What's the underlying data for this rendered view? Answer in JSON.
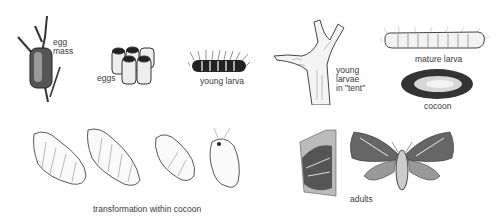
{
  "diagram": {
    "title": "",
    "stages": [
      {
        "id": "egg-mass",
        "label": "egg\nmass"
      },
      {
        "id": "eggs",
        "label": "eggs"
      },
      {
        "id": "young-larva",
        "label": "young larva"
      },
      {
        "id": "young-larvae-tent",
        "label": "young\nlarvae\nin \"tent\""
      },
      {
        "id": "mature-larva",
        "label": "mature larva"
      },
      {
        "id": "cocoon",
        "label": "cocoon"
      },
      {
        "id": "transformation",
        "label": "transformation within cocoon"
      },
      {
        "id": "adults",
        "label": "adults"
      }
    ],
    "colors": {
      "ink": "#2a2a2a",
      "background": "#ffffff"
    }
  }
}
